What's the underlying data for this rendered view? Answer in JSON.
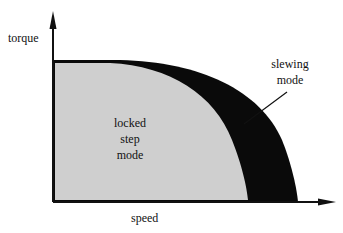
{
  "diagram": {
    "axes": {
      "y_label": "torque",
      "x_label": "speed"
    },
    "regions": [
      {
        "name": "locked step mode",
        "lines": [
          "locked",
          "step",
          "mode"
        ],
        "fill": "#cfcfcf"
      },
      {
        "name": "slewing mode",
        "lines": [
          "slewing",
          "mode"
        ],
        "fill": "#0a0a0a"
      }
    ],
    "colors": {
      "axis": "#111111",
      "locked_fill": "#cfcfcf",
      "slewing_fill": "#0a0a0a",
      "background": "#ffffff"
    }
  }
}
